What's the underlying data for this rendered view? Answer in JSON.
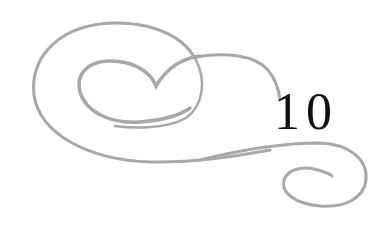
{
  "ornament": {
    "description": "decorative swirl flourish",
    "stroke_color": "#a8a8a8"
  },
  "chapter": {
    "number": "10",
    "text_color": "#111111"
  }
}
